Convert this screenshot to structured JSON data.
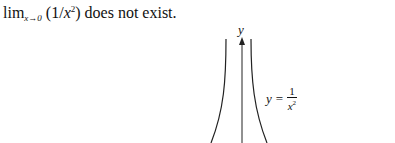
{
  "statement": {
    "lim_text": "lim",
    "subscript": "x→0",
    "expression_open": " (1/",
    "var": "x",
    "exponent": "2",
    "expression_close": ") does not exist."
  },
  "graph": {
    "axis_label": "y",
    "equation": {
      "lhs": "y",
      "equals": "=",
      "numerator": "1",
      "denominator_var": "x",
      "denominator_exp": "2"
    },
    "colors": {
      "curve": "#222222",
      "axis": "#222222"
    }
  }
}
